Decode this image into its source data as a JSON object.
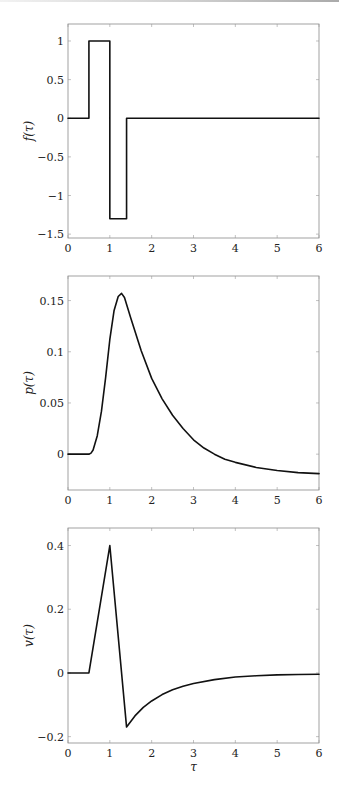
{
  "chart_data": [
    {
      "type": "line",
      "title": "",
      "xlabel": "",
      "ylabel": "f(τ)",
      "xlim": [
        0,
        6
      ],
      "ylim": [
        -1.55,
        1.22
      ],
      "xticks": [
        0,
        1,
        2,
        3,
        4,
        5,
        6
      ],
      "yticks": [
        -1.5,
        -1,
        -0.5,
        0,
        0.5,
        1
      ],
      "ytick_labels": [
        "−1.5",
        "−1",
        "−0.5",
        "0",
        "0.5",
        "1"
      ],
      "grid": false,
      "box": {
        "left": 68,
        "top": 24,
        "right": 319,
        "bottom": 238
      },
      "series": [
        {
          "name": "f",
          "x": [
            0,
            0.5,
            0.5,
            1.0,
            1.0,
            1.4,
            1.4,
            6
          ],
          "y": [
            0,
            0,
            1,
            1,
            -1.3,
            -1.3,
            0,
            0
          ]
        }
      ]
    },
    {
      "type": "line",
      "title": "",
      "xlabel": "",
      "ylabel": "p(τ)",
      "xlim": [
        0,
        6
      ],
      "ylim": [
        -0.035,
        0.174
      ],
      "xticks": [
        0,
        1,
        2,
        3,
        4,
        5,
        6
      ],
      "yticks": [
        0,
        0.05,
        0.1,
        0.15
      ],
      "ytick_labels": [
        "0",
        "0.05",
        "0.1",
        "0.15"
      ],
      "grid": false,
      "box": {
        "left": 68,
        "top": 276,
        "right": 319,
        "bottom": 490
      },
      "series": [
        {
          "name": "p",
          "x": [
            0,
            0.5,
            0.55,
            0.6,
            0.7,
            0.8,
            0.9,
            1.0,
            1.1,
            1.2,
            1.28,
            1.35,
            1.5,
            1.75,
            2.0,
            2.25,
            2.5,
            2.75,
            3.0,
            3.25,
            3.5,
            3.75,
            4.0,
            4.5,
            5.0,
            5.5,
            6.0
          ],
          "y": [
            0,
            0,
            0.001,
            0.004,
            0.018,
            0.042,
            0.075,
            0.112,
            0.14,
            0.154,
            0.157,
            0.153,
            0.133,
            0.101,
            0.074,
            0.054,
            0.038,
            0.025,
            0.014,
            0.006,
            0.0,
            -0.005,
            -0.008,
            -0.013,
            -0.016,
            -0.018,
            -0.019
          ]
        }
      ]
    },
    {
      "type": "line",
      "title": "",
      "xlabel": "τ",
      "ylabel": "v(τ)",
      "xlim": [
        0,
        6
      ],
      "ylim": [
        -0.22,
        0.455
      ],
      "xticks": [
        0,
        1,
        2,
        3,
        4,
        5,
        6
      ],
      "yticks": [
        -0.2,
        0,
        0.2,
        0.4
      ],
      "ytick_labels": [
        "−0.2",
        "0",
        "0.2",
        "0.4"
      ],
      "grid": false,
      "box": {
        "left": 68,
        "top": 528,
        "right": 319,
        "bottom": 743
      },
      "series": [
        {
          "name": "v",
          "x": [
            0,
            0.5,
            1.0,
            1.4,
            1.6,
            1.8,
            2.0,
            2.25,
            2.5,
            2.75,
            3.0,
            3.5,
            4.0,
            4.5,
            5.0,
            5.5,
            6.0
          ],
          "y": [
            0,
            0,
            0.4,
            -0.17,
            -0.135,
            -0.108,
            -0.088,
            -0.068,
            -0.053,
            -0.042,
            -0.033,
            -0.021,
            -0.013,
            -0.009,
            -0.006,
            -0.005,
            -0.004
          ]
        }
      ]
    }
  ]
}
